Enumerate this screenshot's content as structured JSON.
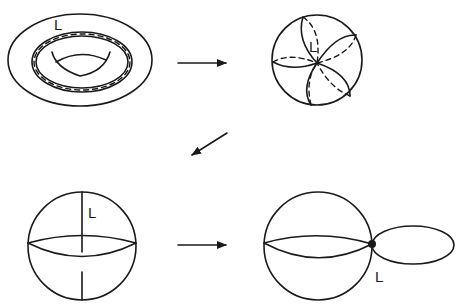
{
  "diagram": {
    "type": "topology-sequence",
    "stroke_color": "#1a1a1a",
    "background": "#ffffff",
    "panels": [
      {
        "id": "torus",
        "label": "L",
        "description": "torus with loop L"
      },
      {
        "id": "petal-sphere",
        "label": "L",
        "description": "sphere with petal curves through point L"
      },
      {
        "id": "meridian-sphere",
        "label": "L",
        "description": "sphere with meridian L"
      },
      {
        "id": "wedge-sphere-circle",
        "label": "L",
        "description": "sphere wedge circle at point L"
      }
    ],
    "arrows": [
      {
        "from": "torus",
        "to": "petal-sphere",
        "direction": "right"
      },
      {
        "from": "petal-sphere",
        "to": "meridian-sphere",
        "direction": "down-left"
      },
      {
        "from": "meridian-sphere",
        "to": "wedge-sphere-circle",
        "direction": "right"
      }
    ]
  }
}
